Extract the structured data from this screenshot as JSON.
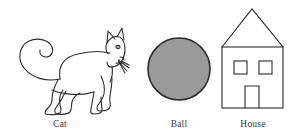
{
  "page": {
    "background_color": "#ffffff",
    "width": 296,
    "height": 139
  },
  "figures": [
    {
      "id": "cat",
      "icon": "cat-line-drawing",
      "caption": "Cat",
      "stroke_color": "#2b2b2b",
      "fill_color": "none",
      "parts": [
        "tail",
        "body",
        "four-legs",
        "paws",
        "head",
        "two-pointed-ears",
        "eye",
        "nose",
        "mouth",
        "whiskers"
      ]
    },
    {
      "id": "ball",
      "icon": "filled-circle",
      "caption": "Ball",
      "stroke_color": "#2b2b2b",
      "fill_color": "#9a9a9a",
      "parts": [
        "circle"
      ]
    },
    {
      "id": "house",
      "icon": "house-line-drawing",
      "caption": "House",
      "stroke_color": "#2b2b2b",
      "fill_color": "none",
      "parts": [
        "triangular-roof",
        "square-body",
        "left-window",
        "right-window",
        "door"
      ]
    }
  ],
  "captions": {
    "cat": "Cat",
    "ball": "Ball",
    "house": "House"
  }
}
